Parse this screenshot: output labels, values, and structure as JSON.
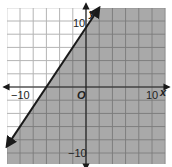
{
  "chart_data": {
    "type": "line",
    "title": "",
    "xlabel": "x",
    "ylabel": "y",
    "xlim": [
      -12,
      12
    ],
    "ylim": [
      -12,
      12
    ],
    "grid": true,
    "grid_step": 2,
    "tick_labels": {
      "x": [
        {
          "value": -10,
          "label": "−10"
        },
        {
          "value": 10,
          "label": "10"
        }
      ],
      "y": [
        {
          "value": 10,
          "label": "10"
        },
        {
          "value": -10,
          "label": "−10"
        }
      ],
      "origin": "O"
    },
    "series": [
      {
        "name": "boundary line",
        "equation": "y = 1.5x + 9",
        "style": "solid",
        "arrows": "both",
        "points": [
          [
            -12,
            -9
          ],
          [
            2,
            12
          ]
        ],
        "x_intercept": -6,
        "y_intercept": 9
      }
    ],
    "shaded_region": {
      "inequality": "y <= 1.5x + 9",
      "side": "right/below line",
      "color": "#a9a9a9"
    }
  },
  "labels": {
    "x_axis": "x",
    "y_axis": "y",
    "origin": "O",
    "x_neg": "−10",
    "x_pos": "10",
    "y_pos": "10",
    "y_neg": "−10"
  },
  "colors": {
    "shade": "#a9a9a9",
    "grid_on_white": "#b4b4b4",
    "grid_on_shade": "#7c7c7c",
    "axis": "#222222",
    "line": "#1a1a1a"
  }
}
